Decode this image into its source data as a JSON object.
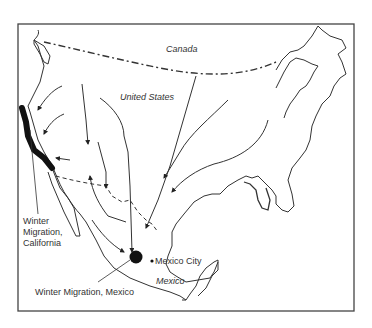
{
  "map": {
    "title_regions": {
      "canada": "Canada",
      "united_states": "United States",
      "mexico": "Mexico"
    },
    "places": {
      "mexico_city": "Mexico City"
    },
    "annotations": {
      "winter_california_line1": "Winter",
      "winter_california_line2": "Migration,",
      "winter_california_line3": "California",
      "winter_mexico": "Winter Migration, Mexico"
    },
    "colors": {
      "line": "#333333",
      "frame": "#444444",
      "overwinter": "#111111",
      "background": "#ffffff"
    }
  }
}
